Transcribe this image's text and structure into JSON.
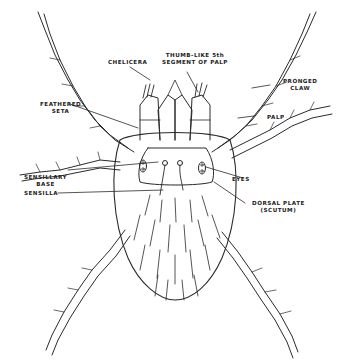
{
  "figure": {
    "line_color": "#2a2a2a",
    "background": "#ffffff",
    "labels": [
      {
        "id": "thumb",
        "text": "THUMB-LIKE 5th\nSEGMENT OF PALP"
      },
      {
        "id": "chelicera",
        "text": "CHELICERA"
      },
      {
        "id": "pronged_claw",
        "text": "PRONGED\nCLAW"
      },
      {
        "id": "feathered_seta",
        "text": "FEATHERED\nSETA"
      },
      {
        "id": "palp",
        "text": "PALP"
      },
      {
        "id": "sensillary_base",
        "text": "SENSILLARY\nBASE"
      },
      {
        "id": "sensilla",
        "text": "SENSILLA"
      },
      {
        "id": "eyes",
        "text": "EYES"
      },
      {
        "id": "dorsal_plate",
        "text": "DORSAL PLATE\n(SCUTUM)"
      }
    ]
  }
}
